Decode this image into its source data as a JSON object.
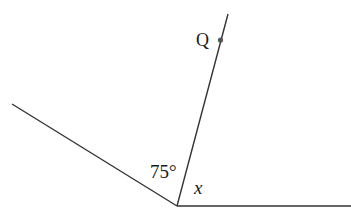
{
  "diagram": {
    "type": "geometry-angles",
    "vertex": {
      "x": 177,
      "y": 206
    },
    "rays": [
      {
        "name": "left-ray",
        "to": {
          "x": 12,
          "y": 104
        }
      },
      {
        "name": "upper-ray",
        "to": {
          "x": 228,
          "y": 14
        }
      },
      {
        "name": "horizontal-ray",
        "to": {
          "x": 351,
          "y": 206
        }
      }
    ],
    "point_Q": {
      "label": "Q",
      "x": 220,
      "y": 40
    },
    "angles": [
      {
        "label": "75°",
        "between": [
          "left-ray",
          "upper-ray"
        ]
      },
      {
        "label": "x",
        "between": [
          "upper-ray",
          "horizontal-ray"
        ],
        "italic": true
      }
    ],
    "line_color": "#333333",
    "text_color": "#1a1a1a"
  }
}
